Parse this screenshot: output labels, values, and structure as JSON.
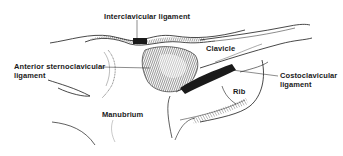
{
  "figure": {
    "ink_color": "#1a1a1a",
    "background": "#ffffff"
  },
  "labels": {
    "interclavicular": "Interclavicular ligament",
    "clavicle": "Clavicle",
    "anterior_line1": "Anterior sternoclavicular",
    "anterior_line2": "ligament",
    "costoclavicular_line1": "Costoclavicular",
    "costoclavicular_line2": "ligament",
    "rib": "Rib",
    "manubrium": "Manubrium"
  }
}
